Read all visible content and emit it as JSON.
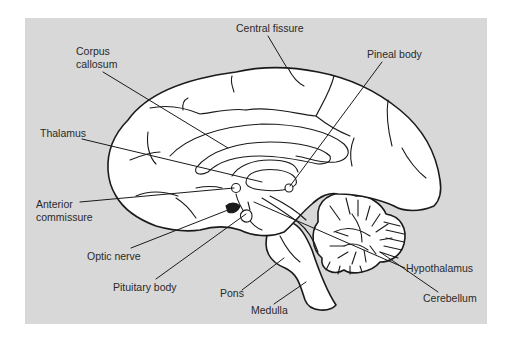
{
  "diagram": {
    "background_color": "#d8d8d8",
    "line_color": "#1a1a1a",
    "fill_color": "#ffffff"
  },
  "labels": {
    "central_fissure": "Central fissure",
    "corpus_callosum": [
      "Corpus",
      "callosum"
    ],
    "pineal_body": "Pineal body",
    "thalamus": "Thalamus",
    "anterior_commissure": [
      "Anterior",
      "commissure"
    ],
    "optic_nerve": "Optic nerve",
    "pituitary_body": "Pituitary body",
    "pons": "Pons",
    "medulla": "Medulla",
    "hypothalamus": "Hypothalamus",
    "cerebellum": "Cerebellum"
  }
}
